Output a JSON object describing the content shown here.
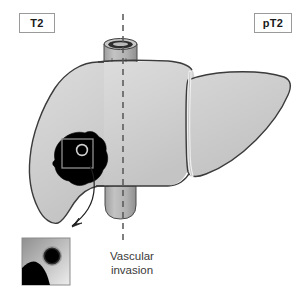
{
  "figure": {
    "stage_left": "T2",
    "stage_right": "pT2",
    "caption_line1": "Vascular",
    "caption_line2": "invasion"
  },
  "colors": {
    "liver_fill_light": "#d9d9d9",
    "liver_fill_mid": "#cccccc",
    "liver_fill_dark": "#bdbdbd",
    "outline": "#3b3b3b",
    "vessel_fill": "#b4b4b4",
    "vessel_dark": "#6e6e6e",
    "tumor": "#000000",
    "midline": "#555555",
    "box_border": "#9a9a9a",
    "text": "#1a1a1a",
    "caption_text": "#3a3a3a",
    "background": "#ffffff",
    "inset_light": "#e2e2e2",
    "inset_dark": "#9e9e9e"
  },
  "anatomy": {
    "liver_label": "liver",
    "right_lobe_label": "right lobe",
    "left_lobe_label": "left lobe",
    "superior_vessel_label": "inferior vena cava superior stump",
    "inferior_vessel_label": "inferior vena cava inferior stump",
    "tumor_label": "primary tumour",
    "satellite_label": "vessel with tumour thrombus",
    "midline_label": "midline plane",
    "callout_label": "magnified region",
    "arrow_label": "callout arrow",
    "inset_label": "magnified inset"
  }
}
